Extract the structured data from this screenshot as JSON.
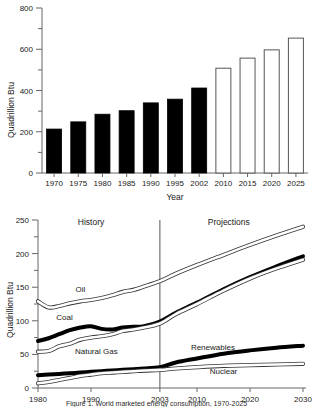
{
  "figure": {
    "caption": "Figure 1. World marketed energy consumption, 1970-2025"
  },
  "chart_data": [
    {
      "id": "bar-chart",
      "type": "bar",
      "title": "",
      "xlabel": "Year",
      "ylabel": "Quadrillion Btu",
      "categories": [
        "1970",
        "1975",
        "1980",
        "1985",
        "1990",
        "1995",
        "2002",
        "2010",
        "2015",
        "2020",
        "2025"
      ],
      "values": [
        213,
        248,
        285,
        302,
        340,
        358,
        412,
        508,
        557,
        597,
        654
      ],
      "series_kind": [
        "history",
        "history",
        "history",
        "history",
        "history",
        "history",
        "history",
        "projection",
        "projection",
        "projection",
        "projection"
      ],
      "ylim": [
        0,
        800
      ],
      "yticks": [
        0,
        200,
        400,
        600,
        800
      ],
      "ytick_labels": [
        "0",
        "200",
        "400",
        "600",
        "800"
      ],
      "minor_tick_step": 100,
      "grid": false,
      "legend": "none",
      "colors": {
        "history_fill": "#000000",
        "projection_fill": "#ffffff",
        "bar_stroke": "#555555",
        "axis": "#666666"
      }
    },
    {
      "id": "line-chart",
      "type": "line",
      "title": "",
      "xlabel": "",
      "ylabel": "Quadrillion Btu",
      "ylim": [
        0,
        250
      ],
      "yticks": [
        0,
        50,
        100,
        150,
        200,
        250
      ],
      "ytick_labels": [
        "0",
        "50",
        "100",
        "150",
        "200",
        "250"
      ],
      "minor_tick_step": 25,
      "xlim": [
        1980,
        2030
      ],
      "xticks": [
        1980,
        1990,
        2003,
        2010,
        2020,
        2030
      ],
      "xtick_labels": [
        "1980",
        "1990",
        "2003",
        "2010",
        "2020",
        "2030"
      ],
      "grid": false,
      "legend": "inline-labels",
      "annotations": [
        {
          "text": "History",
          "x": 1990,
          "y": 243
        },
        {
          "text": "Projections",
          "x": 2016,
          "y": 243
        }
      ],
      "divider": {
        "x": 2003,
        "label": "2003"
      },
      "series": [
        {
          "name": "Oil",
          "style": "thin-outline",
          "label_x": 1988,
          "label_y": 143,
          "x": [
            1980,
            1982,
            1984,
            1986,
            1988,
            1990,
            1992,
            1994,
            1996,
            1998,
            2000,
            2003,
            2006,
            2010,
            2015,
            2020,
            2025,
            2030
          ],
          "values": [
            129,
            120,
            122,
            126,
            129,
            131,
            134,
            138,
            143,
            146,
            151,
            159,
            170,
            183,
            198,
            213,
            227,
            240
          ]
        },
        {
          "name": "Coal",
          "style": "thick-black",
          "label_x": 1985,
          "label_y": 101,
          "x": [
            1980,
            1982,
            1984,
            1986,
            1988,
            1990,
            1992,
            1994,
            1996,
            1998,
            2000,
            2003,
            2006,
            2010,
            2015,
            2020,
            2025,
            2030
          ],
          "values": [
            70,
            74,
            80,
            86,
            90,
            92,
            88,
            87,
            90,
            91,
            92,
            99,
            112,
            127,
            147,
            165,
            181,
            196
          ]
        },
        {
          "name": "Natural Gas",
          "style": "thin-outline",
          "label_x": 1991,
          "label_y": 51,
          "x": [
            1980,
            1982,
            1984,
            1986,
            1988,
            1990,
            1992,
            1994,
            1996,
            1998,
            2000,
            2003,
            2006,
            2010,
            2015,
            2020,
            2025,
            2030
          ],
          "values": [
            54,
            55,
            62,
            66,
            72,
            75,
            77,
            80,
            85,
            87,
            90,
            96,
            110,
            125,
            145,
            163,
            178,
            191
          ]
        },
        {
          "name": "Renewables",
          "style": "thick-black",
          "label_x": 2013,
          "label_y": 57,
          "x": [
            1980,
            1982,
            1984,
            1986,
            1988,
            1990,
            1992,
            1994,
            1996,
            1998,
            2000,
            2003,
            2006,
            2010,
            2015,
            2020,
            2025,
            2030
          ],
          "values": [
            19,
            20,
            21,
            22,
            23,
            24,
            25,
            26,
            27,
            28,
            29,
            31,
            38,
            44,
            51,
            56,
            60,
            63
          ]
        },
        {
          "name": "Nuclear",
          "style": "thin-outline",
          "label_x": 2015,
          "label_y": 21,
          "x": [
            1980,
            1982,
            1984,
            1986,
            1988,
            1990,
            1992,
            1994,
            1996,
            1998,
            2000,
            2003,
            2006,
            2010,
            2015,
            2020,
            2025,
            2030
          ],
          "values": [
            7,
            9,
            12,
            15,
            18,
            20,
            22,
            23,
            24,
            25,
            26,
            27,
            29,
            31,
            33,
            34,
            35,
            36
          ]
        }
      ]
    }
  ],
  "bar_chart": {
    "ylabel": "Quadrillion Btu",
    "xlabel": "Year",
    "ytick_labels": [
      "800",
      "600",
      "400",
      "200",
      "0"
    ],
    "xtick_labels": [
      "1970",
      "1975",
      "1980",
      "1985",
      "1990",
      "1995",
      "2002",
      "2010",
      "2015",
      "2020",
      "2025"
    ]
  },
  "line_chart": {
    "ylabel": "Quadrillion Btu",
    "ytick_labels": [
      "250",
      "200",
      "150",
      "100",
      "50",
      "0"
    ],
    "xtick_labels": [
      "1980",
      "1990",
      "2003",
      "2010",
      "2020",
      "2030"
    ],
    "history_label": "History",
    "projections_label": "Projections",
    "series_labels": [
      "Oil",
      "Coal",
      "Natural Gas",
      "Renewables",
      "Nuclear"
    ]
  }
}
